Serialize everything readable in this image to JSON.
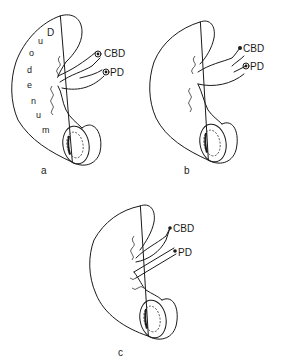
{
  "figure": {
    "panels": [
      {
        "id": "a",
        "caption": "a",
        "labels": {
          "cbd": "CBD",
          "pd": "PD"
        },
        "organ_letters": [
          "D",
          "u",
          "o",
          "d",
          "e",
          "n",
          "u",
          "m"
        ]
      },
      {
        "id": "b",
        "caption": "b",
        "labels": {
          "cbd": "CBD",
          "pd": "PD"
        }
      },
      {
        "id": "c",
        "caption": "c",
        "labels": {
          "cbd": "CBD",
          "pd": "PD"
        }
      }
    ],
    "colors": {
      "ink": "#1a1a1a",
      "background": "#ffffff"
    }
  }
}
